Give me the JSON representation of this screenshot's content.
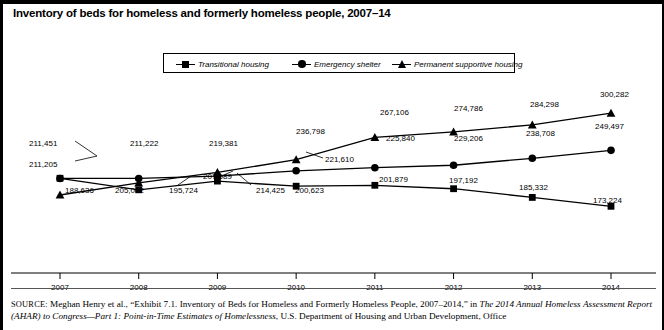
{
  "figure": {
    "title": "Inventory of beds for homeless and formerly homeless people, 2007–14",
    "source_prefix": "SOURCE:",
    "source_line1_a": " Meghan Henry et al., “Exhibit 7.1. Inventory of Beds for Homeless and Formerly Homeless People, 2007–2014,” in ",
    "source_line1_i": "The 2014 Annual Homeless",
    "source_line2_i": "Assessment Report (AHAR) to Congress—Part 1: Point-in-Time Estimates of Homelessness",
    "source_line2_a": ", U.S. Department of Housing and Urban Development, Office"
  },
  "chart_data": {
    "type": "line",
    "title": "Inventory of beds for homeless and formerly homeless people, 2007–14",
    "xlabel": "",
    "ylabel": "",
    "categories": [
      "2007",
      "2008",
      "2009",
      "2010",
      "2011",
      "2012",
      "2013",
      "2014"
    ],
    "ylim": [
      160000,
      310000
    ],
    "grid": false,
    "legend_position": "top-center",
    "series": [
      {
        "name": "Transitional housing",
        "marker": "square",
        "values": [
          211451,
          195724,
          207589,
          200623,
          201879,
          197192,
          185332,
          173224
        ],
        "labels": [
          "211,451",
          "195,724",
          "207,589",
          "200,623",
          "201,879",
          "197,192",
          "185,332",
          "173,224"
        ]
      },
      {
        "name": "Emergency shelter",
        "marker": "circle",
        "values": [
          211205,
          211222,
          214425,
          221610,
          225840,
          229206,
          238708,
          249497
        ],
        "labels": [
          "211,205",
          "211,222",
          "214,425",
          "221,610",
          "225,840",
          "229,206",
          "238,708",
          "249,497"
        ]
      },
      {
        "name": "Permanent supportive housing",
        "marker": "triangle",
        "values": [
          188636,
          205062,
          219381,
          236798,
          267106,
          274786,
          284298,
          300282
        ],
        "labels": [
          "188,636",
          "205,062",
          "219,381",
          "236,798",
          "267,106",
          "274,786",
          "284,298",
          "300,282"
        ]
      }
    ],
    "colors": {
      "line": "#000000",
      "background": "#ffffff"
    }
  },
  "legend": {
    "items": [
      {
        "label": "Transitional housing",
        "marker": "square"
      },
      {
        "label": "Emergency shelter",
        "marker": "circle"
      },
      {
        "label": "Permanent supportive housing",
        "marker": "triangle"
      }
    ]
  },
  "axis": {
    "x_ticks": [
      "2007",
      "2008",
      "2009",
      "2010",
      "2011",
      "2012",
      "2013",
      "2014"
    ]
  },
  "value_labels": [
    {
      "text": "211,451",
      "x": 26,
      "y": 139,
      "name": "label-transitional-2007"
    },
    {
      "text": "211,205",
      "x": 26,
      "y": 160,
      "name": "label-emergency-2007"
    },
    {
      "text": "188,636",
      "x": 62,
      "y": 186,
      "name": "label-permanent-2007"
    },
    {
      "text": "211,222",
      "x": 127,
      "y": 139,
      "name": "label-emergency-2008"
    },
    {
      "text": "205,062",
      "x": 112,
      "y": 186,
      "name": "label-permanent-2008"
    },
    {
      "text": "195,724",
      "x": 166,
      "y": 186,
      "name": "label-transitional-2008"
    },
    {
      "text": "219,381",
      "x": 206,
      "y": 139,
      "name": "label-permanent-2009"
    },
    {
      "text": "207,589",
      "x": 200,
      "y": 172,
      "name": "label-transitional-2009"
    },
    {
      "text": "214,425",
      "x": 253,
      "y": 186,
      "name": "label-emergency-2009"
    },
    {
      "text": "236,798",
      "x": 293,
      "y": 127,
      "name": "label-permanent-2010"
    },
    {
      "text": "221,610",
      "x": 322,
      "y": 155,
      "name": "label-emergency-2010"
    },
    {
      "text": "200,623",
      "x": 292,
      "y": 186,
      "name": "label-transitional-2010"
    },
    {
      "text": "267,106",
      "x": 377,
      "y": 108,
      "name": "label-permanent-2011"
    },
    {
      "text": "225,840",
      "x": 383,
      "y": 134,
      "name": "label-emergency-2011"
    },
    {
      "text": "201,879",
      "x": 376,
      "y": 175,
      "name": "label-transitional-2011"
    },
    {
      "text": "274,786",
      "x": 451,
      "y": 104,
      "name": "label-permanent-2012"
    },
    {
      "text": "229,206",
      "x": 451,
      "y": 134,
      "name": "label-emergency-2012"
    },
    {
      "text": "197,192",
      "x": 446,
      "y": 176,
      "name": "label-transitional-2012"
    },
    {
      "text": "284,298",
      "x": 527,
      "y": 100,
      "name": "label-permanent-2013"
    },
    {
      "text": "238,708",
      "x": 523,
      "y": 129,
      "name": "label-emergency-2013"
    },
    {
      "text": "185,332",
      "x": 516,
      "y": 183,
      "name": "label-transitional-2013"
    },
    {
      "text": "300,282",
      "x": 597,
      "y": 90,
      "name": "label-permanent-2014"
    },
    {
      "text": "249,497",
      "x": 592,
      "y": 122,
      "name": "label-emergency-2014"
    },
    {
      "text": "173,224",
      "x": 590,
      "y": 196,
      "name": "label-transitional-2014"
    }
  ]
}
